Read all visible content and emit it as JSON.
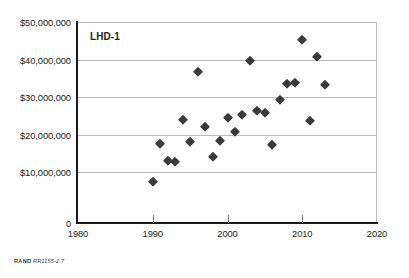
{
  "figure": {
    "series_label": "LHD-1",
    "footnote_prefix": "RAND",
    "footnote_id": "RR1155-2.7"
  },
  "chart_data": {
    "type": "scatter",
    "title": "LHD-1",
    "xlabel": "",
    "ylabel": "",
    "xlim": [
      1980,
      2020
    ],
    "ylim": [
      0,
      50000000
    ],
    "grid": true,
    "legend": "none",
    "xtick_labels": [
      "1980",
      "1990",
      "2000",
      "2010",
      "2020"
    ],
    "xticks": [
      1980,
      1990,
      2000,
      2010,
      2020
    ],
    "ytick_labels": [
      "0",
      "$10,000,000",
      "$20,000,000",
      "$30,000,000",
      "$40,000,000",
      "$50,000,000"
    ],
    "yticks": [
      0,
      10000000,
      20000000,
      30000000,
      40000000,
      50000000
    ],
    "marker": "diamond",
    "marker_color": "#3a3a3a",
    "series": [
      {
        "name": "LHD-1",
        "points": [
          {
            "x": 1990,
            "y": 8000000
          },
          {
            "x": 1991,
            "y": 17500000
          },
          {
            "x": 1992,
            "y": 13000000
          },
          {
            "x": 1993,
            "y": 12800000
          },
          {
            "x": 1994,
            "y": 24000000
          },
          {
            "x": 1995,
            "y": 17900000
          },
          {
            "x": 1996,
            "y": 36800000
          },
          {
            "x": 1997,
            "y": 21900000
          },
          {
            "x": 1998,
            "y": 14000000
          },
          {
            "x": 1999,
            "y": 18300000
          },
          {
            "x": 2000,
            "y": 24500000
          },
          {
            "x": 2001,
            "y": 20600000
          },
          {
            "x": 2002,
            "y": 25300000
          },
          {
            "x": 2003,
            "y": 39700000
          },
          {
            "x": 2004,
            "y": 26200000
          },
          {
            "x": 2005,
            "y": 25700000
          },
          {
            "x": 2006,
            "y": 17200000
          },
          {
            "x": 2007,
            "y": 29200000
          },
          {
            "x": 2008,
            "y": 33500000
          },
          {
            "x": 2009,
            "y": 33700000
          },
          {
            "x": 2010,
            "y": 45200000
          },
          {
            "x": 2011,
            "y": 23700000
          },
          {
            "x": 2012,
            "y": 40700000
          },
          {
            "x": 2013,
            "y": 33200000
          }
        ]
      }
    ]
  }
}
